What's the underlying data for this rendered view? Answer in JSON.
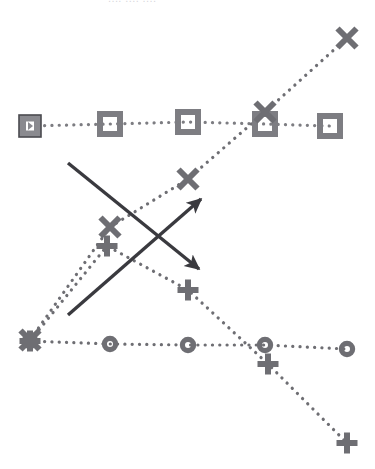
{
  "chart": {
    "title_clipped": "....   ....      ....",
    "background": "#ffffff",
    "series_color": "#6e6e73",
    "annotation_color": "#3a3a3f",
    "selection_fill": "#8a8a8f",
    "selection_stroke": "#4a4a4f"
  },
  "chart_data": {
    "type": "line",
    "title": "",
    "xlabel": "",
    "ylabel": "",
    "grid": false,
    "legend": "none",
    "line_style": "dotted",
    "marker_only_no_axes": true,
    "xlim": [
      0,
      375
    ],
    "ylim": [
      469,
      0
    ],
    "x": [
      30,
      110,
      188,
      265,
      347
    ],
    "series": [
      {
        "name": "squares",
        "marker": "square",
        "color": "#7d7d82",
        "points": [
          {
            "x": 30,
            "y": 126,
            "selected": true
          },
          {
            "x": 110,
            "y": 124,
            "selected": false
          },
          {
            "x": 188,
            "y": 122,
            "selected": false
          },
          {
            "x": 265,
            "y": 124,
            "selected": false
          },
          {
            "x": 330,
            "y": 126,
            "selected": false
          }
        ]
      },
      {
        "name": "crosses",
        "marker": "x",
        "color": "#6e6e73",
        "points": [
          {
            "x": 30,
            "y": 340
          },
          {
            "x": 110,
            "y": 227
          },
          {
            "x": 188,
            "y": 179
          },
          {
            "x": 265,
            "y": 112
          },
          {
            "x": 347,
            "y": 38
          }
        ]
      },
      {
        "name": "circles",
        "marker": "circle",
        "color": "#6e6e73",
        "points": [
          {
            "x": 30,
            "y": 341
          },
          {
            "x": 110,
            "y": 344
          },
          {
            "x": 188,
            "y": 345
          },
          {
            "x": 265,
            "y": 345
          },
          {
            "x": 347,
            "y": 349
          }
        ]
      },
      {
        "name": "pluses",
        "marker": "plus",
        "color": "#6e6e73",
        "points": [
          {
            "x": 30,
            "y": 341
          },
          {
            "x": 107,
            "y": 246
          },
          {
            "x": 188,
            "y": 290
          },
          {
            "x": 268,
            "y": 364
          },
          {
            "x": 347,
            "y": 443
          }
        ]
      }
    ],
    "annotations": [
      {
        "name": "arrow-down-right",
        "type": "arrow",
        "from": {
          "x": 68,
          "y": 163
        },
        "to": {
          "x": 199,
          "y": 269
        },
        "color": "#3a3a3f"
      },
      {
        "name": "arrow-up-right",
        "type": "arrow",
        "from": {
          "x": 68,
          "y": 315
        },
        "to": {
          "x": 201,
          "y": 199
        },
        "color": "#3a3a3f"
      }
    ]
  }
}
